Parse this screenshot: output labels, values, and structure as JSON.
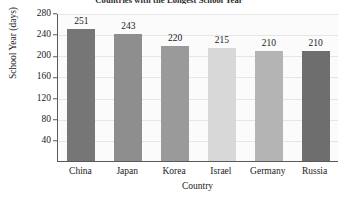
{
  "chart_data": {
    "type": "bar",
    "title": "Countries with the Longest School Year",
    "xlabel": "Country",
    "ylabel": "School Year (days)",
    "categories": [
      "China",
      "Japan",
      "Korea",
      "Israel",
      "Germany",
      "Russia"
    ],
    "values": [
      251,
      243,
      220,
      215,
      210,
      210
    ],
    "value_labels": [
      "251",
      "243",
      "220",
      "215",
      "210",
      "210"
    ],
    "bar_colors": [
      "#767676",
      "#8e8e8e",
      "#9a9a9a",
      "#d8d8d8",
      "#b4b4b4",
      "#6e6e6e"
    ],
    "ylim": [
      0,
      280
    ],
    "yticks": [
      280,
      240,
      200,
      160,
      120,
      80,
      40
    ],
    "ytick_labels": [
      "280",
      "240",
      "200",
      "160",
      "120",
      "80",
      "40"
    ],
    "grid": true,
    "legend": "none",
    "axis_color": "#5a5a5a",
    "grid_color": "#e6e6e6",
    "plot_background": "#fbfbfb"
  }
}
